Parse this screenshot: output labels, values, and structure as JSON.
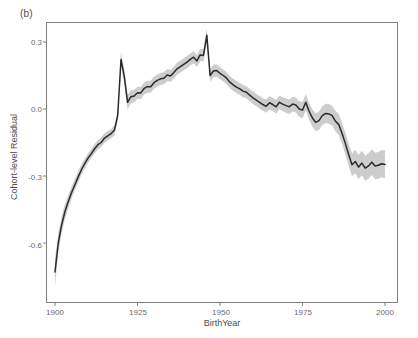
{
  "figure": {
    "panel_label": "(b)",
    "background_color": "#ffffff"
  },
  "chart_data": {
    "type": "line",
    "title": "",
    "subtitle": "",
    "panel": "(b)",
    "xlabel": "BirthYear",
    "ylabel": "Cohort-level Residual",
    "xlim": [
      1897,
      2002
    ],
    "ylim": [
      -0.82,
      0.42
    ],
    "xticks": [
      1900,
      1925,
      1950,
      1975,
      2000
    ],
    "xtick_labels": [
      "1900",
      "1925",
      "1950",
      "1975",
      "2000"
    ],
    "yticks": [
      0.3,
      0.0,
      -0.3,
      -0.6
    ],
    "ytick_labels": [
      "0.3",
      "0.0",
      "-0.3",
      "-0.6"
    ],
    "grid": false,
    "legend": "none",
    "line_color": "#2b2b2b",
    "band_color": "#c8c8c8",
    "band_label": "confidence interval",
    "series": [
      {
        "name": "Cohort-level Residual",
        "x": [
          1900,
          1901,
          1902,
          1903,
          1904,
          1905,
          1906,
          1907,
          1908,
          1909,
          1910,
          1911,
          1912,
          1913,
          1914,
          1915,
          1916,
          1917,
          1918,
          1919,
          1920,
          1921,
          1922,
          1923,
          1924,
          1925,
          1926,
          1927,
          1928,
          1929,
          1930,
          1931,
          1932,
          1933,
          1934,
          1935,
          1936,
          1937,
          1938,
          1939,
          1940,
          1941,
          1942,
          1943,
          1944,
          1945,
          1946,
          1947,
          1948,
          1949,
          1950,
          1951,
          1952,
          1953,
          1954,
          1955,
          1956,
          1957,
          1958,
          1959,
          1960,
          1961,
          1962,
          1963,
          1964,
          1965,
          1966,
          1967,
          1968,
          1969,
          1970,
          1971,
          1972,
          1973,
          1974,
          1975,
          1976,
          1977,
          1978,
          1979,
          1980,
          1981,
          1982,
          1983,
          1984,
          1985,
          1986,
          1987,
          1988,
          1989,
          1990,
          1991,
          1992,
          1993,
          1994,
          1995,
          1996,
          1997,
          1998,
          1999,
          2000
        ],
        "values": [
          -0.73,
          -0.6,
          -0.52,
          -0.46,
          -0.415,
          -0.375,
          -0.34,
          -0.305,
          -0.272,
          -0.245,
          -0.22,
          -0.2,
          -0.178,
          -0.16,
          -0.15,
          -0.13,
          -0.12,
          -0.11,
          -0.095,
          -0.03,
          0.222,
          0.145,
          0.03,
          0.055,
          0.058,
          0.073,
          0.072,
          0.092,
          0.1,
          0.1,
          0.118,
          0.128,
          0.135,
          0.138,
          0.152,
          0.148,
          0.163,
          0.18,
          0.19,
          0.2,
          0.21,
          0.222,
          0.232,
          0.215,
          0.242,
          0.24,
          0.33,
          0.15,
          0.17,
          0.172,
          0.16,
          0.15,
          0.138,
          0.12,
          0.108,
          0.098,
          0.09,
          0.08,
          0.075,
          0.062,
          0.05,
          0.04,
          0.03,
          0.02,
          0.012,
          0.028,
          0.02,
          0.01,
          0.03,
          0.022,
          0.015,
          0.01,
          0.022,
          0.018,
          0.0,
          -0.005,
          0.03,
          -0.01,
          -0.04,
          -0.06,
          -0.052,
          -0.03,
          -0.02,
          -0.022,
          -0.03,
          -0.055,
          -0.07,
          -0.11,
          -0.155,
          -0.205,
          -0.25,
          -0.235,
          -0.26,
          -0.242,
          -0.265,
          -0.255,
          -0.238,
          -0.255,
          -0.252,
          -0.245,
          -0.248
        ],
        "band_lower": [
          -0.79,
          -0.645,
          -0.558,
          -0.493,
          -0.445,
          -0.402,
          -0.365,
          -0.329,
          -0.295,
          -0.267,
          -0.242,
          -0.221,
          -0.199,
          -0.181,
          -0.171,
          -0.151,
          -0.141,
          -0.131,
          -0.117,
          -0.055,
          0.19,
          0.112,
          -0.003,
          0.026,
          0.03,
          0.046,
          0.045,
          0.065,
          0.073,
          0.073,
          0.091,
          0.101,
          0.108,
          0.111,
          0.125,
          0.121,
          0.136,
          0.153,
          0.163,
          0.173,
          0.183,
          0.195,
          0.205,
          0.188,
          0.215,
          0.213,
          0.3,
          0.122,
          0.142,
          0.144,
          0.133,
          0.123,
          0.111,
          0.093,
          0.081,
          0.071,
          0.063,
          0.053,
          0.048,
          0.035,
          0.022,
          0.012,
          0.002,
          -0.008,
          -0.017,
          -0.002,
          -0.01,
          -0.02,
          0.0,
          -0.009,
          -0.017,
          -0.023,
          -0.011,
          -0.016,
          -0.035,
          -0.041,
          -0.007,
          -0.048,
          -0.079,
          -0.1,
          -0.093,
          -0.072,
          -0.063,
          -0.066,
          -0.075,
          -0.101,
          -0.117,
          -0.158,
          -0.204,
          -0.255,
          -0.301,
          -0.288,
          -0.314,
          -0.297,
          -0.321,
          -0.312,
          -0.296,
          -0.314,
          -0.312,
          -0.306,
          -0.31
        ],
        "band_upper": [
          -0.67,
          -0.555,
          -0.482,
          -0.427,
          -0.385,
          -0.348,
          -0.315,
          -0.281,
          -0.249,
          -0.223,
          -0.198,
          -0.179,
          -0.157,
          -0.139,
          -0.129,
          -0.109,
          -0.099,
          -0.089,
          -0.073,
          -0.005,
          0.254,
          0.178,
          0.063,
          0.084,
          0.086,
          0.1,
          0.099,
          0.119,
          0.127,
          0.127,
          0.145,
          0.155,
          0.162,
          0.165,
          0.179,
          0.175,
          0.19,
          0.207,
          0.217,
          0.227,
          0.237,
          0.249,
          0.259,
          0.242,
          0.269,
          0.267,
          0.36,
          0.178,
          0.198,
          0.2,
          0.187,
          0.177,
          0.165,
          0.147,
          0.135,
          0.125,
          0.117,
          0.107,
          0.102,
          0.089,
          0.078,
          0.068,
          0.058,
          0.048,
          0.041,
          0.058,
          0.05,
          0.04,
          0.06,
          0.053,
          0.047,
          0.043,
          0.055,
          0.052,
          0.035,
          0.031,
          0.067,
          0.028,
          -0.001,
          -0.02,
          -0.011,
          0.012,
          0.023,
          0.022,
          0.015,
          -0.009,
          -0.023,
          -0.062,
          -0.106,
          -0.155,
          -0.199,
          -0.182,
          -0.206,
          -0.187,
          -0.209,
          -0.198,
          -0.18,
          -0.196,
          -0.192,
          -0.184,
          -0.186
        ]
      }
    ]
  }
}
